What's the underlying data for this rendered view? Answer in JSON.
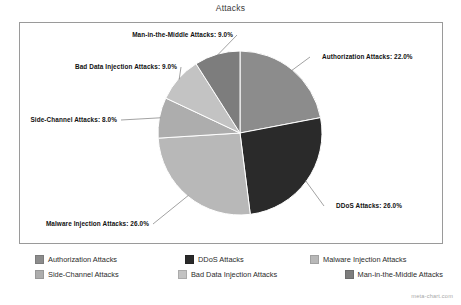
{
  "chart_data": {
    "type": "pie",
    "title": "Attacks",
    "xlabel": "",
    "ylabel": "",
    "legend_position": "bottom",
    "grid": false,
    "start_angle_deg": 0,
    "direction": "clockwise",
    "categories": [
      "Authorization Attacks",
      "DDoS Attacks",
      "Malware Injection Attacks",
      "Side-Channel Attacks",
      "Bad Data Injection Attacks",
      "Man-in-the-Middle Attacks"
    ],
    "values": [
      22.0,
      26.0,
      26.0,
      8.0,
      9.0,
      9.0
    ],
    "value_suffix": "%",
    "colors": [
      "#8c8c8c",
      "#2a2a2a",
      "#b8b8b8",
      "#adadad",
      "#c3c3c3",
      "#7d7d7d"
    ],
    "slices": [
      {
        "label": "Authorization Attacks",
        "value": 22.0,
        "annotation": "Authorization Attacks: 22.0%",
        "color": "#8c8c8c"
      },
      {
        "label": "DDoS Attacks",
        "value": 26.0,
        "annotation": "DDoS Attacks: 26.0%",
        "color": "#2a2a2a"
      },
      {
        "label": "Malware Injection Attacks",
        "value": 26.0,
        "annotation": "Malware Injection Attacks: 26.0%",
        "color": "#b8b8b8"
      },
      {
        "label": "Side-Channel Attacks",
        "value": 8.0,
        "annotation": "Side-Channel Attacks: 8.0%",
        "color": "#adadad"
      },
      {
        "label": "Bad Data Injection Attacks",
        "value": 9.0,
        "annotation": "Bad Data Injection Attacks: 9.0%",
        "color": "#c3c3c3"
      },
      {
        "label": "Man-in-the-Middle Attacks",
        "value": 9.0,
        "annotation": "Man-in-the-Middle Attacks: 9.0%",
        "color": "#7d7d7d"
      }
    ]
  },
  "legend": {
    "row1": [
      {
        "label": "Authorization Attacks",
        "color": "#8c8c8c"
      },
      {
        "label": "DDoS Attacks",
        "color": "#2a2a2a"
      },
      {
        "label": "Malware Injection Attacks",
        "color": "#b8b8b8"
      }
    ],
    "row2": [
      {
        "label": "Side-Channel Attacks",
        "color": "#adadad"
      },
      {
        "label": "Bad Data Injection Attacks",
        "color": "#c3c3c3"
      },
      {
        "label": "Man-in-the-Middle Attacks",
        "color": "#7d7d7d"
      }
    ]
  },
  "watermark": "meta-chart.com"
}
